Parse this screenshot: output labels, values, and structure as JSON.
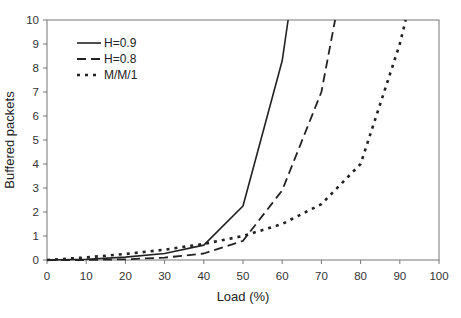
{
  "chart_data": {
    "type": "line",
    "title": "",
    "xlabel": "Load (%)",
    "ylabel": "Buffered packets",
    "xlim": [
      0,
      100
    ],
    "ylim": [
      0,
      10
    ],
    "xticks": [
      0,
      10,
      20,
      30,
      40,
      50,
      60,
      70,
      80,
      90,
      100
    ],
    "yticks": [
      0,
      1,
      2,
      3,
      4,
      5,
      6,
      7,
      8,
      9,
      10
    ],
    "grid": false,
    "legend_position": "upper-left-inside",
    "series": [
      {
        "name": "H=0.9",
        "style": "solid",
        "x": [
          0,
          10,
          20,
          30,
          40,
          50,
          60,
          61.5
        ],
        "y": [
          0,
          0.03,
          0.12,
          0.27,
          0.62,
          2.25,
          8.3,
          10
        ]
      },
      {
        "name": "H=0.8",
        "style": "dashed",
        "x": [
          0,
          10,
          20,
          30,
          40,
          50,
          60,
          70,
          73.5
        ],
        "y": [
          0,
          0.0,
          0.03,
          0.1,
          0.27,
          0.8,
          2.9,
          7.0,
          10
        ]
      },
      {
        "name": "M/M/1",
        "style": "dotted",
        "x": [
          0,
          10,
          20,
          30,
          40,
          50,
          60,
          70,
          80,
          90,
          91.5
        ],
        "y": [
          0,
          0.11,
          0.25,
          0.43,
          0.67,
          1.0,
          1.5,
          2.33,
          4.0,
          9.0,
          10
        ]
      }
    ]
  }
}
